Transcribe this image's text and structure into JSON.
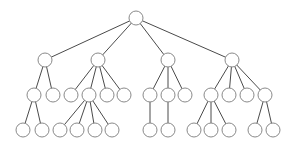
{
  "diagram": {
    "type": "tree",
    "node_radius": 7,
    "colors": {
      "edge": "#4a4a4a",
      "node_stroke": "#8a8a8a",
      "node_fill": "#ffffff",
      "background": "#ffffff"
    },
    "nodes": [
      {
        "id": "r",
        "x": 136,
        "y": 18
      },
      {
        "id": "a",
        "x": 45,
        "y": 60
      },
      {
        "id": "b",
        "x": 98,
        "y": 60
      },
      {
        "id": "c",
        "x": 168,
        "y": 60
      },
      {
        "id": "d",
        "x": 232,
        "y": 60
      },
      {
        "id": "a1",
        "x": 34,
        "y": 95
      },
      {
        "id": "a2",
        "x": 53,
        "y": 95
      },
      {
        "id": "b1",
        "x": 71,
        "y": 95
      },
      {
        "id": "b2",
        "x": 89,
        "y": 95
      },
      {
        "id": "b3",
        "x": 107,
        "y": 95
      },
      {
        "id": "b4",
        "x": 124,
        "y": 95
      },
      {
        "id": "c1",
        "x": 150,
        "y": 95
      },
      {
        "id": "c2",
        "x": 168,
        "y": 95
      },
      {
        "id": "c3",
        "x": 185,
        "y": 95
      },
      {
        "id": "d1",
        "x": 211,
        "y": 95
      },
      {
        "id": "d2",
        "x": 229,
        "y": 95
      },
      {
        "id": "d3",
        "x": 247,
        "y": 95
      },
      {
        "id": "d4",
        "x": 265,
        "y": 95
      },
      {
        "id": "a1a",
        "x": 23,
        "y": 130
      },
      {
        "id": "a1b",
        "x": 42,
        "y": 130
      },
      {
        "id": "b2a",
        "x": 60,
        "y": 130
      },
      {
        "id": "b2b",
        "x": 77,
        "y": 130
      },
      {
        "id": "b2c",
        "x": 95,
        "y": 130
      },
      {
        "id": "b2d",
        "x": 112,
        "y": 130
      },
      {
        "id": "c1a",
        "x": 150,
        "y": 130
      },
      {
        "id": "c2a",
        "x": 168,
        "y": 130
      },
      {
        "id": "d1a",
        "x": 194,
        "y": 130
      },
      {
        "id": "d1b",
        "x": 211,
        "y": 130
      },
      {
        "id": "d1c",
        "x": 229,
        "y": 130
      },
      {
        "id": "d4a",
        "x": 255,
        "y": 130
      },
      {
        "id": "d4b",
        "x": 273,
        "y": 130
      }
    ],
    "edges": [
      [
        "r",
        "a"
      ],
      [
        "r",
        "b"
      ],
      [
        "r",
        "c"
      ],
      [
        "r",
        "d"
      ],
      [
        "a",
        "a1"
      ],
      [
        "a",
        "a2"
      ],
      [
        "b",
        "b1"
      ],
      [
        "b",
        "b2"
      ],
      [
        "b",
        "b3"
      ],
      [
        "b",
        "b4"
      ],
      [
        "c",
        "c1"
      ],
      [
        "c",
        "c2"
      ],
      [
        "c",
        "c3"
      ],
      [
        "d",
        "d1"
      ],
      [
        "d",
        "d2"
      ],
      [
        "d",
        "d3"
      ],
      [
        "d",
        "d4"
      ],
      [
        "a1",
        "a1a"
      ],
      [
        "a1",
        "a1b"
      ],
      [
        "b2",
        "b2a"
      ],
      [
        "b2",
        "b2b"
      ],
      [
        "b2",
        "b2c"
      ],
      [
        "b2",
        "b2d"
      ],
      [
        "c1",
        "c1a"
      ],
      [
        "c2",
        "c2a"
      ],
      [
        "d1",
        "d1a"
      ],
      [
        "d1",
        "d1b"
      ],
      [
        "d1",
        "d1c"
      ],
      [
        "d4",
        "d4a"
      ],
      [
        "d4",
        "d4b"
      ]
    ]
  }
}
